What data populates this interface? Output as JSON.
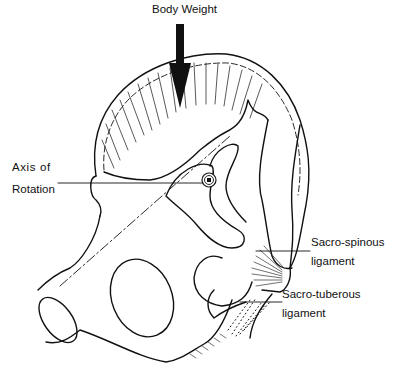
{
  "diagram": {
    "labels": {
      "body_weight": "Body Weight",
      "axis_line1": "Axis of",
      "axis_line2": "Rotation",
      "sacrospinous_line1": "Sacro-spinous",
      "sacrospinous_line2": "ligament",
      "sacrotuberous_line1": "Sacro-tuberous",
      "sacrotuberous_line2": "ligament"
    },
    "icons": {
      "arrow": "down-arrow",
      "axis_marker": "circled-dot"
    },
    "colors": {
      "ink": "#111111",
      "background": "#ffffff"
    }
  }
}
